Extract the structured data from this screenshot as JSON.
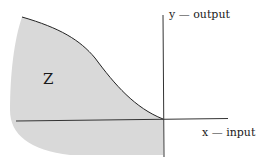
{
  "labels": {
    "y_axis": "y — output",
    "x_axis": "x — input",
    "region": "Z"
  },
  "colors": {
    "region_fill": "#d9d9d9",
    "line": "#222222",
    "background": "#ffffff"
  }
}
